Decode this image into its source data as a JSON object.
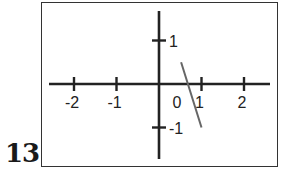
{
  "figure_number": "13",
  "chart_data": {
    "type": "line",
    "title": "",
    "xlabel": "",
    "ylabel": "",
    "xlim": [
      -2.6,
      2.6
    ],
    "ylim": [
      -1.8,
      1.7
    ],
    "grid": false,
    "x_ticks": [
      -2,
      -1,
      0,
      1,
      2
    ],
    "x_tick_labels": [
      "-2",
      "-1",
      "0",
      "1",
      "2"
    ],
    "y_ticks": [
      1,
      -1
    ],
    "y_tick_labels": [
      "1",
      "-1"
    ],
    "series": [
      {
        "name": "segment",
        "x": [
          0.52,
          1.0
        ],
        "y": [
          0.5,
          -1.0
        ],
        "color": "#666666"
      }
    ]
  }
}
